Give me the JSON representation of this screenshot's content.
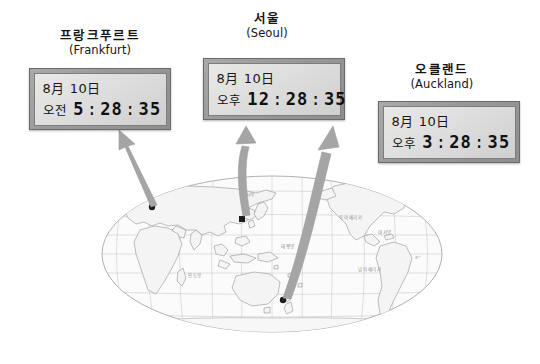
{
  "figure": {
    "type": "world-time-zone-diagram",
    "background_color": "#ffffff"
  },
  "clocks": [
    {
      "id": "frankfurt",
      "name_ko": "프랑크푸르트",
      "name_en": "(Frankfurt)",
      "date": "8月 10日",
      "meridiem": "오전",
      "hour": "5",
      "minute": "28",
      "second": "35",
      "separator": ":",
      "bezel_color": "#9a9a9a",
      "screen_color": "#dedede"
    },
    {
      "id": "seoul",
      "name_ko": "서울",
      "name_en": "(Seoul)",
      "date": "8月 10日",
      "meridiem": "오후",
      "hour": "12",
      "minute": "28",
      "second": "35",
      "separator": ":",
      "bezel_color": "#9a9a9a",
      "screen_color": "#dedede"
    },
    {
      "id": "auckland",
      "name_ko": "오클랜드",
      "name_en": "(Auckland)",
      "date": "8月 10日",
      "meridiem": "오후",
      "hour": "3",
      "minute": "28",
      "second": "35",
      "separator": ":",
      "bezel_color": "#9a9a9a",
      "screen_color": "#dedede"
    }
  ],
  "map": {
    "projection": "robinson",
    "center_meridian": "pacific-centered",
    "ocean_color": "#fbfbfb",
    "outline_color": "#8a8a8a",
    "graticule_color": "#b8b8b8",
    "city_marker_color": "#1c1c1c",
    "scale_bar": {
      "zero_label": "0",
      "distance_label": "3000km"
    },
    "labels": [
      {
        "text": "유럽",
        "x": 88,
        "y": 17
      },
      {
        "text": "아시아",
        "x": 150,
        "y": 28
      },
      {
        "text": "북아메리카",
        "x": 253,
        "y": 51
      },
      {
        "text": "대서양",
        "x": 287,
        "y": 66
      },
      {
        "text": "태평양",
        "x": 190,
        "y": 80
      },
      {
        "text": "인도양",
        "x": 97,
        "y": 109
      },
      {
        "text": "남아메리카",
        "x": 272,
        "y": 103
      },
      {
        "text": "0°",
        "x": 318,
        "y": 91
      }
    ],
    "city_markers": [
      {
        "id": "frankfurt",
        "label": "Frankfurt",
        "x": 54,
        "y": 39
      },
      {
        "id": "seoul",
        "label": "Seoul",
        "x": 144,
        "y": 51
      },
      {
        "id": "auckland",
        "label": "Auckland",
        "x": 185,
        "y": 132
      }
    ]
  },
  "arrows": [
    {
      "id": "arrow-to-frankfurt",
      "from": "map-frankfurt",
      "to": "clock-frankfurt",
      "color": "#9e9e9e",
      "shape": "straight"
    },
    {
      "id": "arrow-to-seoul",
      "from": "map-seoul",
      "to": "clock-seoul",
      "color": "#9e9e9e",
      "shape": "curved"
    },
    {
      "id": "arrow-to-auckland",
      "from": "map-auckland",
      "to": "clock-auckland",
      "color": "#9e9e9e",
      "shape": "curved-long"
    }
  ]
}
